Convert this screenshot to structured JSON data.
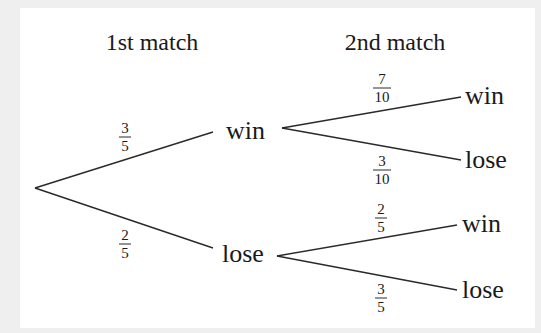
{
  "diagram": {
    "type": "probability-tree",
    "headers": {
      "first": "1st match",
      "second": "2nd match"
    },
    "colors": {
      "background": "#efefef",
      "panel": "#ffffff",
      "line": "#2a2a2a",
      "text": "#1a1a1a"
    },
    "first_match": {
      "win": {
        "label": "win",
        "probability": {
          "num": "3",
          "den": "5"
        }
      },
      "lose": {
        "label": "lose",
        "probability": {
          "num": "2",
          "den": "5"
        }
      }
    },
    "second_match": {
      "after_win": {
        "win": {
          "label": "win",
          "probability": {
            "num": "7",
            "den": "10"
          }
        },
        "lose": {
          "label": "lose",
          "probability": {
            "num": "3",
            "den": "10"
          }
        }
      },
      "after_lose": {
        "win": {
          "label": "win",
          "probability": {
            "num": "2",
            "den": "5"
          }
        },
        "lose": {
          "label": "lose",
          "probability": {
            "num": "3",
            "den": "5"
          }
        }
      }
    }
  }
}
